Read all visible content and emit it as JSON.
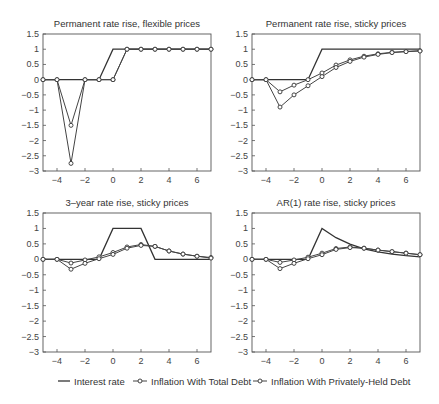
{
  "figure": {
    "legend": {
      "items": [
        {
          "label": "Interest rate",
          "style": "line"
        },
        {
          "label": "Inflation With Total Debt",
          "style": "line-circle"
        },
        {
          "label": "Inflation With Privately-Held Debt",
          "style": "line-circle"
        }
      ]
    }
  },
  "chart_data": [
    {
      "type": "line",
      "title": "Permanent rate rise, flexible prices",
      "xlabel": "",
      "ylabel": "",
      "xlim": [
        -5,
        7
      ],
      "ylim": [
        -3,
        1.5
      ],
      "xticks": [
        -4,
        -2,
        0,
        2,
        4,
        6
      ],
      "yticks": [
        1.5,
        1,
        0.5,
        0,
        -0.5,
        -1,
        -1.5,
        -2,
        -2.5,
        -3
      ],
      "ytick_labels": [
        "1.5",
        "1",
        "0.5",
        "0",
        "−0.5",
        "−1",
        "−1.5",
        "−2",
        "−2.5",
        "−3"
      ],
      "grid": false,
      "x": [
        -5,
        -4,
        -3,
        -2,
        -1,
        0,
        1,
        2,
        3,
        4,
        5,
        6,
        7
      ],
      "series": [
        {
          "name": "Interest rate",
          "values": [
            0,
            0,
            0,
            0,
            0,
            1,
            1,
            1,
            1,
            1,
            1,
            1,
            1
          ]
        },
        {
          "name": "Inflation With Total Debt",
          "values": [
            0,
            0,
            -1.5,
            0,
            0,
            0,
            1,
            1,
            1,
            1,
            1,
            1,
            1
          ]
        },
        {
          "name": "Inflation With Privately-Held Debt",
          "values": [
            0,
            0,
            -2.75,
            0,
            0,
            0,
            1,
            1,
            1,
            1,
            1,
            1,
            1
          ]
        }
      ]
    },
    {
      "type": "line",
      "title": "Permanent rate rise, sticky prices",
      "xlabel": "",
      "ylabel": "",
      "xlim": [
        -5,
        7
      ],
      "ylim": [
        -3,
        1.5
      ],
      "xticks": [
        -4,
        -2,
        0,
        2,
        4,
        6
      ],
      "yticks": [
        1.5,
        1,
        0.5,
        0,
        -0.5,
        -1,
        -1.5,
        -2,
        -2.5,
        -3
      ],
      "ytick_labels": [
        "1.5",
        "1",
        "0.5",
        "0",
        "−0.5",
        "−1",
        "−1.5",
        "−2",
        "−2.5",
        "−3"
      ],
      "grid": false,
      "x": [
        -5,
        -4,
        -3,
        -2,
        -1,
        0,
        1,
        2,
        3,
        4,
        5,
        6,
        7
      ],
      "series": [
        {
          "name": "Interest rate",
          "values": [
            0,
            0,
            0,
            0,
            0,
            1,
            1,
            1,
            1,
            1,
            1,
            1,
            1
          ]
        },
        {
          "name": "Inflation With Total Debt",
          "values": [
            0,
            0,
            -0.4,
            -0.18,
            0,
            0.22,
            0.48,
            0.65,
            0.77,
            0.85,
            0.9,
            0.93,
            0.95
          ]
        },
        {
          "name": "Inflation With Privately-Held Debt",
          "values": [
            0,
            0,
            -0.9,
            -0.5,
            -0.2,
            0.1,
            0.4,
            0.6,
            0.74,
            0.83,
            0.89,
            0.92,
            0.94
          ]
        }
      ]
    },
    {
      "type": "line",
      "title": "3–year rate rise, sticky prices",
      "xlabel": "",
      "ylabel": "",
      "xlim": [
        -5,
        7
      ],
      "ylim": [
        -3,
        1.5
      ],
      "xticks": [
        -4,
        -2,
        0,
        2,
        4,
        6
      ],
      "yticks": [
        1.5,
        1,
        0.5,
        0,
        -0.5,
        -1,
        -1.5,
        -2,
        -2.5,
        -3
      ],
      "ytick_labels": [
        "1.5",
        "1",
        "0.5",
        "0",
        "−0.5",
        "−1",
        "−1.5",
        "−2",
        "−2.5",
        "−3"
      ],
      "grid": false,
      "x": [
        -5,
        -4,
        -3,
        -2,
        -1,
        0,
        1,
        2,
        3,
        4,
        5,
        6,
        7
      ],
      "series": [
        {
          "name": "Interest rate",
          "values": [
            0,
            0,
            0,
            0,
            0,
            1,
            1,
            1,
            0,
            0,
            0,
            0,
            0
          ]
        },
        {
          "name": "Inflation With Total Debt",
          "values": [
            0,
            0,
            -0.12,
            -0.02,
            0.08,
            0.22,
            0.4,
            0.48,
            0.42,
            0.27,
            0.17,
            0.1,
            0.06
          ]
        },
        {
          "name": "Inflation With Privately-Held Debt",
          "values": [
            0,
            0,
            -0.32,
            -0.13,
            0.02,
            0.16,
            0.36,
            0.45,
            0.42,
            0.27,
            0.17,
            0.1,
            0.04
          ]
        }
      ]
    },
    {
      "type": "line",
      "title": "AR(1) rate rise, sticky prices",
      "xlabel": "",
      "ylabel": "",
      "xlim": [
        -5,
        7
      ],
      "ylim": [
        -3,
        1.5
      ],
      "xticks": [
        -4,
        -2,
        0,
        2,
        4,
        6
      ],
      "yticks": [
        1.5,
        1,
        0.5,
        0,
        -0.5,
        -1,
        -1.5,
        -2,
        -2.5,
        -3
      ],
      "ytick_labels": [
        "1.5",
        "1",
        "0.5",
        "0",
        "−0.5",
        "−1",
        "−1.5",
        "−2",
        "−2.5",
        "−3"
      ],
      "grid": false,
      "x": [
        -5,
        -4,
        -3,
        -2,
        -1,
        0,
        1,
        2,
        3,
        4,
        5,
        6,
        7
      ],
      "series": [
        {
          "name": "Interest rate",
          "values": [
            0,
            0,
            0,
            0,
            0,
            1,
            0.7,
            0.49,
            0.34,
            0.24,
            0.17,
            0.12,
            0.08
          ]
        },
        {
          "name": "Inflation With Total Debt",
          "values": [
            0,
            0,
            -0.1,
            -0.02,
            0.07,
            0.2,
            0.35,
            0.4,
            0.36,
            0.3,
            0.25,
            0.2,
            0.15
          ]
        },
        {
          "name": "Inflation With Privately-Held Debt",
          "values": [
            0,
            0,
            -0.3,
            -0.13,
            0.02,
            0.15,
            0.32,
            0.38,
            0.36,
            0.3,
            0.25,
            0.2,
            0.15
          ]
        }
      ]
    }
  ]
}
